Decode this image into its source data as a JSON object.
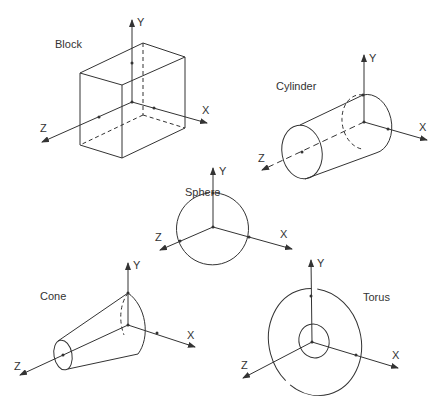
{
  "diagram": {
    "type": "primitive-solids-coordinate-axes",
    "line_color": "#333333",
    "shapes": [
      {
        "name": "Block",
        "axes": {
          "x": "X",
          "y": "Y",
          "z": "Z"
        }
      },
      {
        "name": "Cylinder",
        "axes": {
          "x": "X",
          "y": "Y",
          "z": "Z"
        }
      },
      {
        "name": "Sphere",
        "axes": {
          "x": "X",
          "y": "Y",
          "z": "Z"
        }
      },
      {
        "name": "Cone",
        "axes": {
          "x": "X",
          "y": "Y",
          "z": "Z"
        }
      },
      {
        "name": "Torus",
        "axes": {
          "x": "X",
          "y": "Y",
          "z": "Z"
        }
      }
    ]
  }
}
